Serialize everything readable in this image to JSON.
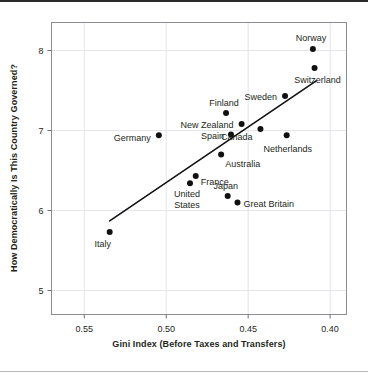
{
  "chart_data": {
    "type": "scatter",
    "title": "",
    "xlabel": "Gini Index (Before Taxes and Transfers)",
    "ylabel": "How Democratically Is This Country Governed?",
    "xlim": [
      0.57,
      0.39
    ],
    "ylim": [
      4.7,
      8.35
    ],
    "x_axis_reversed": true,
    "xticks": [
      0.55,
      0.5,
      0.45,
      0.4
    ],
    "xtick_labels": [
      "0.55",
      "0.50",
      "0.45",
      "0.40"
    ],
    "yticks": [
      5,
      6,
      7,
      8
    ],
    "ytick_labels": [
      "5",
      "6",
      "7",
      "8"
    ],
    "grid": true,
    "legend": "none",
    "marker_color": "#111111",
    "trendline": {
      "label": "",
      "x_start": 0.5345,
      "y_start": 5.87,
      "x_end": 0.4085,
      "y_end": 7.62,
      "color": "#111111"
    },
    "points": [
      {
        "name": "Italy",
        "x": 0.5345,
        "y": 5.73,
        "label_dx": -7,
        "label_dy": 15,
        "label_anchor": "middle"
      },
      {
        "name": "Germany",
        "x": 0.5045,
        "y": 6.94,
        "label_dx": -8,
        "label_dy": 6,
        "label_anchor": "end"
      },
      {
        "name": "United",
        "x": 0.4855,
        "y": 6.34,
        "label_dx": -3,
        "label_dy": 14,
        "label_anchor": "middle"
      },
      {
        "name": "States",
        "x": 0.4855,
        "y": 6.34,
        "label_dx": -3,
        "label_dy": 25,
        "label_anchor": "middle",
        "continuation": true
      },
      {
        "name": "France",
        "x": 0.482,
        "y": 6.43,
        "label_dx": 5,
        "label_dy": 9,
        "label_anchor": "start"
      },
      {
        "name": "Australia",
        "x": 0.4665,
        "y": 6.7,
        "label_dx": 4,
        "label_dy": 12,
        "label_anchor": "start"
      },
      {
        "name": "Spain",
        "x": 0.4605,
        "y": 6.95,
        "label_dx": -7,
        "label_dy": 4,
        "label_anchor": "end"
      },
      {
        "name": "New Zealand",
        "x": 0.454,
        "y": 7.08,
        "label_dx": -8,
        "label_dy": 4,
        "label_anchor": "end"
      },
      {
        "name": "Finland",
        "x": 0.4635,
        "y": 7.22,
        "label_dx": -2,
        "label_dy": -7,
        "label_anchor": "middle"
      },
      {
        "name": "Japan",
        "x": 0.4625,
        "y": 6.18,
        "label_dx": -2,
        "label_dy": -7,
        "label_anchor": "middle"
      },
      {
        "name": "Great Britain",
        "x": 0.4565,
        "y": 6.1,
        "label_dx": 6,
        "label_dy": 4,
        "label_anchor": "start"
      },
      {
        "name": "Canada",
        "x": 0.4425,
        "y": 7.02,
        "label_dx": -8,
        "label_dy": 11,
        "label_anchor": "end"
      },
      {
        "name": "Netherlands",
        "x": 0.4265,
        "y": 6.94,
        "label_dx": 1,
        "label_dy": 17,
        "label_anchor": "middle"
      },
      {
        "name": "Sweden",
        "x": 0.4275,
        "y": 7.43,
        "label_dx": -8,
        "label_dy": 4,
        "label_anchor": "end"
      },
      {
        "name": "Norway",
        "x": 0.4105,
        "y": 8.02,
        "label_dx": -2,
        "label_dy": -8,
        "label_anchor": "middle"
      },
      {
        "name": "Switzerland",
        "x": 0.4095,
        "y": 7.78,
        "label_dx": 3,
        "label_dy": 15,
        "label_anchor": "middle"
      }
    ]
  }
}
